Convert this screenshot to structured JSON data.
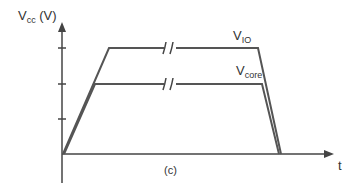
{
  "diagram": {
    "y_axis_label": {
      "main": "V",
      "sub": "cc",
      "unit": " (V)"
    },
    "x_axis_label": "t",
    "caption": "(c)",
    "curves": [
      {
        "name": "V_IO",
        "main": "V",
        "sub": "IO",
        "level": "high"
      },
      {
        "name": "V_core",
        "main": "V",
        "sub": "core",
        "level": "low"
      }
    ],
    "y_ticks": 3,
    "break_marker": "//",
    "color": "#444444"
  }
}
